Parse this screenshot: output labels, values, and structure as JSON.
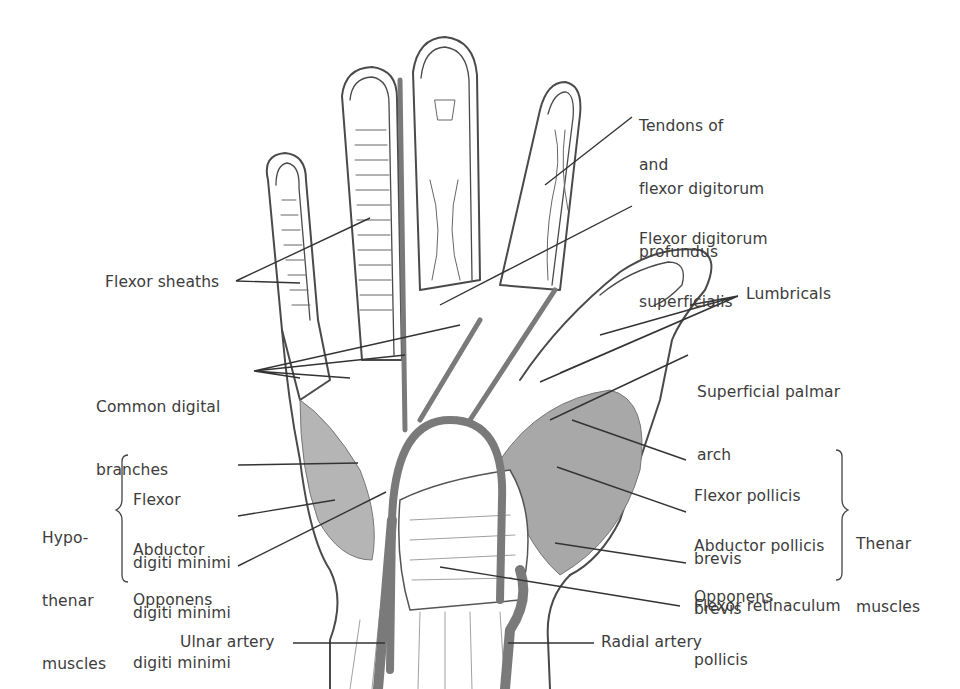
{
  "diagram": {
    "colors": {
      "outline": "#4a4a4a",
      "artery": "#7a7a7a",
      "muscle": "#8c8c8c",
      "text": "#3c3c3c",
      "background": "#ffffff"
    },
    "labels": {
      "tendons_fdp": [
        "Tendons of",
        "flexor digitorum",
        "profundus"
      ],
      "and": "and",
      "fds": [
        "Flexor digitorum",
        "superficialis"
      ],
      "flexor_sheaths": "Flexor sheaths",
      "lumbricals": "Lumbricals",
      "common_digital": [
        "Common digital",
        "branches"
      ],
      "superficial_arch": [
        "Superficial palmar",
        "arch"
      ],
      "hypothenar_group": [
        "Hypo-",
        "thenar",
        "muscles"
      ],
      "fdm": [
        "Flexor",
        "digiti minimi"
      ],
      "adm": [
        "Abductor",
        "digiti minimi"
      ],
      "odm": [
        "Opponens",
        "digiti minimi"
      ],
      "fpb": [
        "Flexor pollicis",
        "brevis"
      ],
      "apb": [
        "Abductor pollicis",
        "brevis"
      ],
      "op": [
        "Opponens",
        "pollicis"
      ],
      "thenar_group": [
        "Thenar",
        "muscles"
      ],
      "flexor_retinaculum": "Flexor retinaculum",
      "ulnar_artery": "Ulnar artery",
      "radial_artery": "Radial artery"
    }
  }
}
